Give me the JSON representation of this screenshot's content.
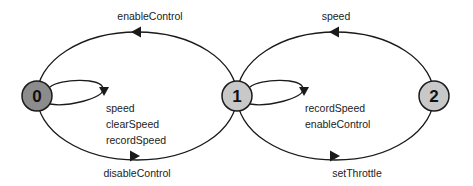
{
  "diagram": {
    "type": "state-machine",
    "nodes": [
      {
        "id": "0",
        "label": "0",
        "fill": "#8c8c8c"
      },
      {
        "id": "1",
        "label": "1",
        "fill": "#c8c8c8"
      },
      {
        "id": "2",
        "label": "2",
        "fill": "#c8c8c8"
      }
    ],
    "edges": [
      {
        "from": "0",
        "to": "1",
        "label": "enableControl"
      },
      {
        "from": "1",
        "to": "0",
        "label": "disableControl"
      },
      {
        "from": "0",
        "to": "0",
        "labels": [
          "speed",
          "clearSpeed",
          "recordSpeed"
        ]
      },
      {
        "from": "1",
        "to": "2",
        "label": "speed"
      },
      {
        "from": "2",
        "to": "1",
        "label": "setThrottle"
      },
      {
        "from": "1",
        "to": "1",
        "labels": [
          "recordSpeed",
          "enableControl"
        ]
      }
    ]
  }
}
